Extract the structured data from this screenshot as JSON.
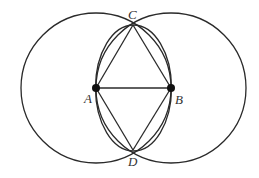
{
  "diagram": {
    "type": "geometric-construction",
    "colors": {
      "line": "#2a2a2a",
      "point": "#111111",
      "label": "#333333",
      "background": "#ffffff"
    },
    "points": {
      "A": {
        "label": "A",
        "x": 96,
        "y": 88
      },
      "B": {
        "label": "B",
        "x": 171,
        "y": 88
      },
      "C": {
        "label": "C",
        "x": 133,
        "y": 25
      },
      "D": {
        "label": "D",
        "x": 133,
        "y": 150
      }
    },
    "circles": [
      {
        "name": "circle-A",
        "center": "A",
        "rx": 75,
        "ry": 75
      },
      {
        "name": "circle-B",
        "center": "B",
        "rx": 75,
        "ry": 75
      },
      {
        "name": "circle-ACBD",
        "cx": 133.5,
        "cy": 88,
        "rx": 38,
        "ry": 63
      }
    ],
    "segments": [
      [
        "A",
        "B"
      ],
      [
        "A",
        "C"
      ],
      [
        "C",
        "B"
      ],
      [
        "A",
        "D"
      ],
      [
        "D",
        "B"
      ]
    ]
  }
}
